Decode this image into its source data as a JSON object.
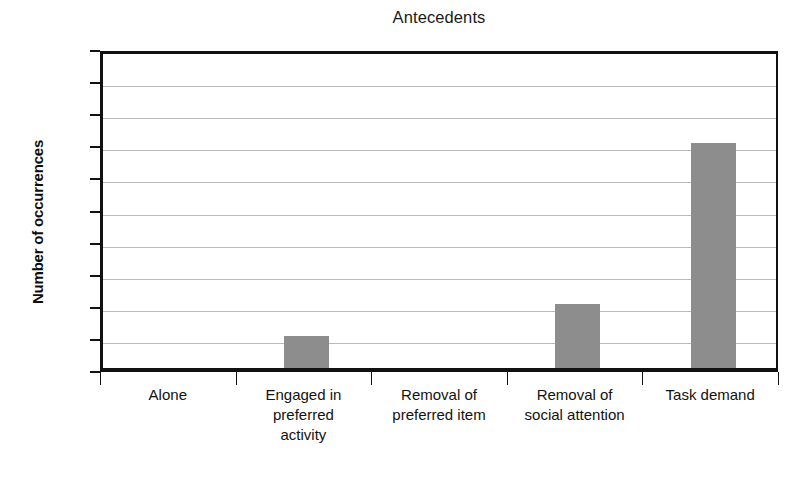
{
  "chart_data": {
    "type": "bar",
    "title": "Antecedents",
    "xlabel": "",
    "ylabel": "Number of occurrences",
    "categories": [
      "Alone",
      "Engaged in preferred activity",
      "Removal of preferred item",
      "Removal of social attention",
      "Task demand"
    ],
    "category_lines": [
      [
        "Alone"
      ],
      [
        "Engaged in",
        "preferred",
        "activity"
      ],
      [
        "Removal of",
        "preferred item"
      ],
      [
        "Removal of",
        "social attention"
      ],
      [
        "Task demand"
      ]
    ],
    "values": [
      0,
      1,
      0,
      2,
      7
    ],
    "ylim": [
      0,
      10
    ],
    "yticks": [
      0,
      1,
      2,
      3,
      4,
      5,
      6,
      7,
      8,
      9,
      10
    ],
    "ytick_labels": [
      "0",
      "1",
      "2",
      "3",
      "4",
      "5",
      "6",
      "7",
      "8",
      "9",
      "10"
    ],
    "grid": true,
    "legend": false,
    "bar_color": "#8d8d8d",
    "axis_color": "#111111",
    "grid_color": "#b9b9b9",
    "background_color": "#ffffff"
  }
}
